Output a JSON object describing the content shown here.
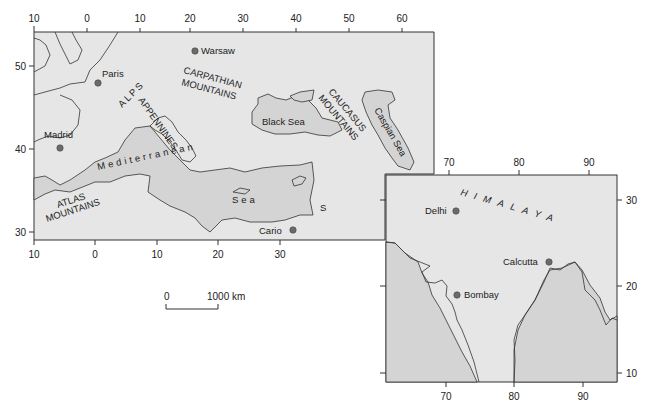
{
  "map1": {
    "title": "Europe & Mediterranean",
    "top_ticks": [
      "10",
      "0",
      "10",
      "20",
      "30",
      "40",
      "50",
      "60"
    ],
    "bottom_ticks": [
      "10",
      "0",
      "10",
      "20",
      "30"
    ],
    "left_ticks": [
      "50",
      "40",
      "30"
    ],
    "cities": [
      {
        "name": "Warsaw"
      },
      {
        "name": "Paris"
      },
      {
        "name": "Madrid"
      },
      {
        "name": "Cario"
      }
    ],
    "features": {
      "alps": "ALPS",
      "appennines": "APPENNINES",
      "carpathian_1": "CARPATHIAN",
      "carpathian_2": "MOUNTAINS",
      "caucasus_1": "CAUCASUS",
      "caucasus_2": "MOUNTAINS",
      "black_sea": "Black Sea",
      "caspian_sea": "Caspian Sea",
      "mediterranean_1": "Mediterranean",
      "mediterranean_2": "Sea",
      "atlas_1": "ATLAS",
      "atlas_2": "MOUNTAINS",
      "s": "S"
    }
  },
  "scale_bar": {
    "start": "0",
    "end": "1000 km"
  },
  "map2": {
    "title": "India",
    "top_ticks": [
      "70",
      "80",
      "90"
    ],
    "bottom_ticks": [
      "70",
      "80",
      "90"
    ],
    "right_ticks": [
      "30",
      "20",
      "10"
    ],
    "cities": [
      {
        "name": "Delhi"
      },
      {
        "name": "Calcutta"
      },
      {
        "name": "Bombay"
      }
    ],
    "features": {
      "himalaya": "HIMALAYA"
    }
  }
}
